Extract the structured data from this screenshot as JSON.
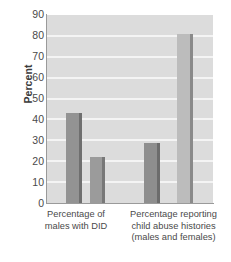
{
  "chart_data": {
    "type": "bar",
    "title": "",
    "xlabel": "",
    "ylabel": "Percent",
    "ylim": [
      0,
      90
    ],
    "ytick_step": 10,
    "yticks": [
      90,
      80,
      70,
      60,
      50,
      40,
      30,
      20,
      10,
      0
    ],
    "grid": true,
    "legend": "none",
    "categories": [
      "Percentage of males with DID",
      "Percentage reporting child abuse histories (males and females)"
    ],
    "category_lines": [
      [
        "Percentage of",
        "males with DID"
      ],
      [
        "Percentage reporting",
        "child abuse histories",
        "(males and females)"
      ]
    ],
    "series": [
      {
        "name": "Series 1",
        "values": [
          43,
          28.5
        ]
      },
      {
        "name": "Series 2",
        "values": [
          22,
          81
        ]
      }
    ],
    "bars": [
      {
        "group": 0,
        "series": 0,
        "value": 43,
        "color": "#939393"
      },
      {
        "group": 0,
        "series": 1,
        "value": 22,
        "color": "#9b9b9b"
      },
      {
        "group": 1,
        "series": 0,
        "value": 28.5,
        "color": "#8e8e8e"
      },
      {
        "group": 1,
        "series": 1,
        "value": 81,
        "color": "#bcbcbc"
      }
    ]
  },
  "axis": {
    "y_title": "Percent",
    "tick_90": "90",
    "tick_80": "80",
    "tick_70": "70",
    "tick_60": "60",
    "tick_50": "50",
    "tick_40": "40",
    "tick_30": "30",
    "tick_20": "20",
    "tick_10": "10",
    "tick_0": "0"
  },
  "xlabels": {
    "group1_line1": "Percentage of",
    "group1_line2": "males with DID",
    "group2_line1": "Percentage reporting",
    "group2_line2": "child abuse histories",
    "group2_line3": "(males and females)"
  },
  "colors": {
    "plot_background": "#dcdcdc",
    "gridline": "#f4f4f4",
    "axis_line": "#9a9a9a",
    "text": "#4a4a4a",
    "bar_dark": "#8e8e8e",
    "bar_light": "#bcbcbc",
    "bar_edge_dark": "#6f6f6f",
    "bar_edge_light": "#8a8a8a",
    "page_background": "#ffffff"
  }
}
